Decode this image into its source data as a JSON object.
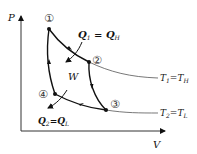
{
  "diagram": {
    "type": "carnot-cycle-pv",
    "axes": {
      "y_label": "P",
      "x_label": "V"
    },
    "points": [
      {
        "id": "1",
        "label": "①"
      },
      {
        "id": "2",
        "label": "②"
      },
      {
        "id": "3",
        "label": "③"
      },
      {
        "id": "4",
        "label": "④"
      }
    ],
    "heat_in": {
      "main": "Q",
      "sub1": "1",
      "eq": " = Q",
      "sub2": "H"
    },
    "work": "W",
    "heat_out": {
      "main": "Q",
      "sub1": "2",
      "eq": "=Q",
      "sub2": "L"
    },
    "isotherm_high": {
      "main": "T",
      "sub1": "1",
      "eq": "=T",
      "sub2": "H"
    },
    "isotherm_low": {
      "main": "T",
      "sub1": "2",
      "eq": "=T",
      "sub2": "L"
    }
  }
}
